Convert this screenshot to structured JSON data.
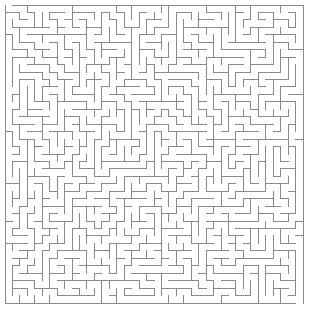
{
  "canvas": {
    "width": 309,
    "height": 310,
    "background_color": "#ffffff"
  },
  "maze": {
    "title": "maze",
    "type": "perfect-maze",
    "cols": 40,
    "rows": 40,
    "origin_x": 5,
    "origin_y": 5,
    "cell_size": 7.45,
    "wall_color": "#8a8a8a",
    "wall_width": 1,
    "border_color": "#8a8a8a",
    "border_width": 1,
    "seed": 20240517,
    "entrance": {
      "side": "top",
      "col": 0,
      "label": "entrance"
    },
    "exit": {
      "side": "bottom",
      "col": 39,
      "label": "exit"
    }
  }
}
